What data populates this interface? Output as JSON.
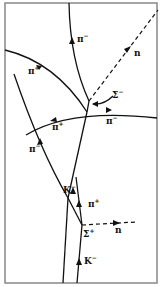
{
  "diagram": {
    "title": "",
    "colors": {
      "ink": "#111111",
      "frame": "#888888",
      "background": "#ffffff"
    },
    "tracks": [
      {
        "id": "pi-minus-top",
        "particle": "π",
        "charge": "−",
        "style": "solid"
      },
      {
        "id": "n-upper",
        "particle": "n",
        "charge": "",
        "style": "dashed"
      },
      {
        "id": "sigma-minus",
        "particle": "Σ",
        "charge": "−",
        "style": "solid"
      },
      {
        "id": "pi-plus-upper-left",
        "particle": "π",
        "charge": "+",
        "style": "solid"
      },
      {
        "id": "arc-pi",
        "particle": "π",
        "charge": "−",
        "style": "solid"
      },
      {
        "id": "pi-minus-left",
        "particle": "π",
        "charge": "−",
        "style": "solid"
      },
      {
        "id": "k-minus-upper",
        "particle": "K",
        "charge": "−",
        "style": "solid"
      },
      {
        "id": "pi-plus-lower",
        "particle": "π",
        "charge": "+",
        "style": "solid"
      },
      {
        "id": "n-lower",
        "particle": "n",
        "charge": "",
        "style": "dashed"
      },
      {
        "id": "sigma-plus",
        "particle": "Σ",
        "charge": "+",
        "style": "solid"
      },
      {
        "id": "k-minus-beam",
        "particle": "K",
        "charge": "−",
        "style": "solid"
      }
    ],
    "labels": {
      "pi_minus_top": {
        "base": "π",
        "sup": "−"
      },
      "n_upper": {
        "base": "n",
        "sup": ""
      },
      "pi_plus_upper": {
        "base": "π",
        "sup": "+"
      },
      "sigma_minus": {
        "base": "Σ",
        "sup": "−"
      },
      "pi_plus_arc": {
        "base": "π",
        "sup": "+"
      },
      "pi_minus_arc": {
        "base": "π",
        "sup": "−"
      },
      "pi_minus_left": {
        "base": "π",
        "sup": "−"
      },
      "k_minus_upper": {
        "base": "K",
        "sup": "−"
      },
      "pi_plus_lower": {
        "base": "π",
        "sup": "+"
      },
      "sigma_plus": {
        "base": "Σ",
        "sup": "+"
      },
      "n_lower": {
        "base": "n",
        "sup": ""
      },
      "k_minus_beam": {
        "base": "K",
        "sup": "−"
      }
    }
  }
}
